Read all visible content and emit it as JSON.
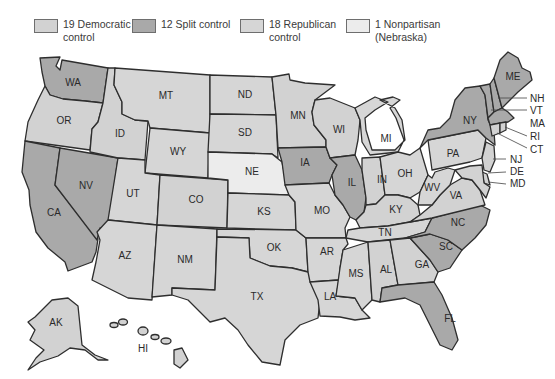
{
  "colors": {
    "democratic": "#d2d2d2",
    "split": "#a9a9a9",
    "republican": "#d6d6d6",
    "nonpartisan": "#ececec",
    "border": "#2e2e2e"
  },
  "legend": [
    {
      "key": "democratic",
      "label": "19 Democratic\ncontrol",
      "count": 19
    },
    {
      "key": "split",
      "label": "12 Split control",
      "count": 12
    },
    {
      "key": "republican",
      "label": "18 Republican\ncontrol",
      "count": 18
    },
    {
      "key": "nonpartisan",
      "label": "1 Nonpartisan\n(Nebraska)",
      "count": 1
    }
  ],
  "states": {
    "WA": "WA",
    "OR": "OR",
    "CA": "CA",
    "NV": "NV",
    "ID": "ID",
    "MT": "MT",
    "WY": "WY",
    "UT": "UT",
    "AZ": "AZ",
    "CO": "CO",
    "NM": "NM",
    "ND": "ND",
    "SD": "SD",
    "NE": "NE",
    "KS": "KS",
    "OK": "OK",
    "TX": "TX",
    "MN": "MN",
    "IA": "IA",
    "MO": "MO",
    "AR": "AR",
    "LA": "LA",
    "WI": "WI",
    "IL": "IL",
    "MI": "MI",
    "IN": "IN",
    "OH": "OH",
    "KY": "KY",
    "TN": "TN",
    "MS": "MS",
    "AL": "AL",
    "GA": "GA",
    "FL": "FL",
    "SC": "SC",
    "NC": "NC",
    "VA": "VA",
    "WV": "WV",
    "PA": "PA",
    "NY": "NY",
    "ME": "ME",
    "NH": "NH",
    "VT": "VT",
    "MA": "MA",
    "RI": "RI",
    "CT": "CT",
    "NJ": "NJ",
    "DE": "DE",
    "MD": "MD",
    "AK": "AK",
    "HI": "HI"
  }
}
